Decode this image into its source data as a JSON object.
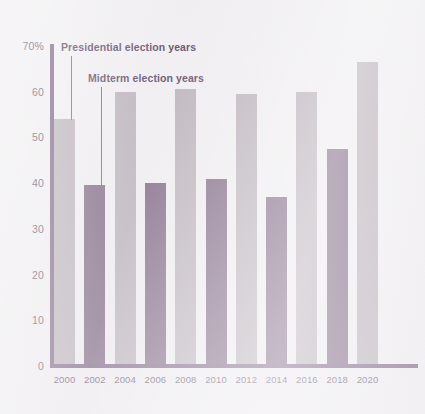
{
  "chart_data": {
    "type": "bar",
    "title": "",
    "subtitle": "",
    "xlabel": "",
    "ylabel": "",
    "categories": [
      "2000",
      "2002",
      "2004",
      "2006",
      "2008",
      "2010",
      "2012",
      "2014",
      "2016",
      "2018",
      "2020"
    ],
    "values": [
      54,
      39.5,
      60,
      40,
      60.5,
      41,
      59.5,
      37,
      60,
      47.5,
      66.5
    ],
    "series": [
      {
        "name": "Presidential election years",
        "color": "#b3aab2",
        "points": [
          {
            "x": "2000",
            "y": 54
          },
          {
            "x": "2004",
            "y": 60
          },
          {
            "x": "2008",
            "y": 60.5
          },
          {
            "x": "2012",
            "y": 59.5
          },
          {
            "x": "2016",
            "y": 60
          },
          {
            "x": "2020",
            "y": 66.5
          }
        ]
      },
      {
        "name": "Midterm election years",
        "color": "#6e5373",
        "points": [
          {
            "x": "2002",
            "y": 39.5
          },
          {
            "x": "2006",
            "y": 40
          },
          {
            "x": "2010",
            "y": 41
          },
          {
            "x": "2014",
            "y": 37
          },
          {
            "x": "2018",
            "y": 47.5
          }
        ]
      }
    ],
    "bar_types": [
      "presidential",
      "midterm",
      "presidential",
      "midterm",
      "presidential",
      "midterm",
      "presidential",
      "midterm",
      "presidential",
      "midterm",
      "presidential"
    ],
    "yticks": [
      "0",
      "10",
      "20",
      "30",
      "40",
      "50",
      "60",
      "70%"
    ],
    "ytick_values": [
      0,
      10,
      20,
      30,
      40,
      50,
      60,
      70
    ],
    "ylim": [
      0,
      70
    ],
    "grid": false,
    "legend_position": "inline-annotations",
    "annotations": [
      {
        "name": "presidential-annotation",
        "text": "Presidential election years",
        "target": "2000"
      },
      {
        "name": "midterm-annotation",
        "text": "Midterm election years",
        "target": "2002"
      }
    ],
    "colors": {
      "presidential_bar": "#b3aab2",
      "midterm_bar": "#6e5373",
      "axis": "#6b4f72",
      "text": "#4d3c55",
      "annotation_text": "#4a3354",
      "background": "#f1eff1"
    }
  }
}
